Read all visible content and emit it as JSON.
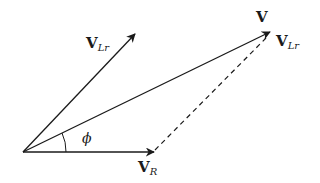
{
  "diagram": {
    "type": "phasor-diagram",
    "colors": {
      "stroke": "#1a1a1a",
      "background": "#ffffff"
    },
    "vectors": [
      {
        "id": "V_R",
        "label": "V",
        "subscript": "R",
        "from": [
          23,
          152
        ],
        "to": [
          154,
          152
        ]
      },
      {
        "id": "V_Lr_left",
        "label": "V",
        "subscript": "Lr",
        "from": [
          23,
          152
        ],
        "to": [
          135,
          34
        ]
      },
      {
        "id": "V",
        "label": "V",
        "subscript": "",
        "from": [
          23,
          152
        ],
        "to": [
          270,
          32
        ]
      }
    ],
    "dashed_line": {
      "label": "V",
      "subscript": "Lr",
      "from": [
        154,
        150
      ],
      "to": [
        268,
        36
      ]
    },
    "angle": {
      "label": "ϕ"
    },
    "labels": {
      "v_r_main": "V",
      "v_r_sub": "R",
      "v_lr_left_main": "V",
      "v_lr_left_sub": "Lr",
      "v_main": "V",
      "v_lr_right_main": "V",
      "v_lr_right_sub": "Lr",
      "phi": "ϕ"
    }
  }
}
